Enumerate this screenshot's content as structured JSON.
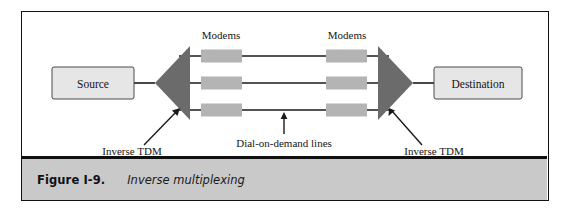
{
  "figure": {
    "caption_number": "Figure I-9.",
    "caption_title": "Inverse multiplexing"
  },
  "diagram": {
    "type": "network-block-diagram",
    "nodes": {
      "source": "Source",
      "destination": "Destination"
    },
    "labels": {
      "modems_left": "Modems",
      "modems_right": "Modems",
      "inverse_tdm_left": "Inverse TDM",
      "inverse_tdm_right": "Inverse TDM",
      "dial_on_demand": "Dial-on-demand lines"
    },
    "counts": {
      "channel_lines": 3,
      "modems_per_side": 3
    },
    "colors": {
      "frame": "#121212",
      "caption_bar": "#c9c9c9",
      "node_box_fill": "#e6e6e6",
      "modem_fill": "#b4b4b4",
      "triangle_fill": "#6b6b6b",
      "line": "#1a1a1a",
      "canvas": "#ffffff"
    }
  }
}
